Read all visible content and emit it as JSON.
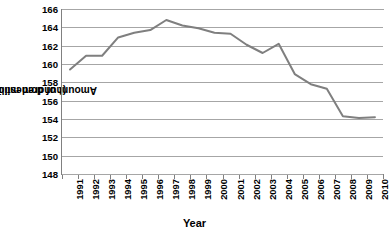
{
  "chart_data": {
    "type": "line",
    "title": "",
    "xlabel": "Year",
    "ylabel": "Amount of domestic water in use (hundred million m³)",
    "ylabel_line1": "Amount of domestic water in use",
    "ylabel_line2": "(hundred million m³)",
    "categories": [
      "1991",
      "1992",
      "1993",
      "1994",
      "1995",
      "1996",
      "1997",
      "1998",
      "1999",
      "2000",
      "2001",
      "2002",
      "2003",
      "2004",
      "2005",
      "2006",
      "2007",
      "2008",
      "2009",
      "2010"
    ],
    "values": [
      159.4,
      160.9,
      160.9,
      162.9,
      163.4,
      163.7,
      164.8,
      164.2,
      163.9,
      163.4,
      163.3,
      162.1,
      161.2,
      162.2,
      158.9,
      157.8,
      157.3,
      154.3,
      154.1,
      154.2
    ],
    "series": [
      {
        "name": "Amount of domestic water in use",
        "values": [
          159.4,
          160.9,
          160.9,
          162.9,
          163.4,
          163.7,
          164.8,
          164.2,
          163.9,
          163.4,
          163.3,
          162.1,
          161.2,
          162.2,
          158.9,
          157.8,
          157.3,
          154.3,
          154.1,
          154.2
        ]
      }
    ],
    "ylim": [
      148,
      166
    ],
    "yticks": [
      148,
      150,
      152,
      154,
      156,
      158,
      160,
      162,
      164,
      166
    ],
    "ytick_labels": [
      "148",
      "150",
      "152",
      "154",
      "156",
      "158",
      "160",
      "162",
      "164",
      "166"
    ],
    "grid": true,
    "legend": false,
    "legend_position": "none",
    "line_color": "#7f7f7f",
    "grid_color": "#a6a6a6",
    "axis_color": "#808080",
    "background_color": "#ffffff"
  }
}
